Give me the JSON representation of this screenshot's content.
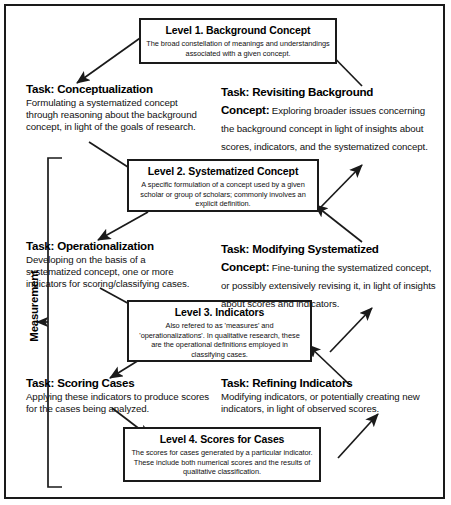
{
  "diagram": {
    "title_hidden": "",
    "colors": {
      "stroke": "#1a1a1a",
      "text": "#000000",
      "background": "#ffffff"
    },
    "bracket_label": "Measurement",
    "levels": [
      {
        "id": "level-1",
        "title": "Level 1. Background Concept",
        "body": "The broad constellation of meanings and understandings associated with a given concept."
      },
      {
        "id": "level-2",
        "title": "Level 2. Systematized Concept",
        "body": "A specific formulation of a concept used by a given scholar or group of scholars; commonly involves an explicit definition."
      },
      {
        "id": "level-3",
        "title": "Level 3. Indicators",
        "body": "Also refered to as 'measures' and 'operationalizations'. In qualitative research, these are the operational definitions employed in classifying cases."
      },
      {
        "id": "level-4",
        "title": "Level 4. Scores for Cases",
        "body": "The scores for cases generated by a particular indicator. These include both numerical scores and the results of qualitative classification."
      }
    ],
    "tasks_left": [
      {
        "id": "task-conceptualization",
        "head": "Task: Conceptualization",
        "body": "Formulating a systematized concept through reasoning about the background concept, in light of the goals of research."
      },
      {
        "id": "task-operationalization",
        "head": "Task: Operationalization",
        "body": "Developing on the basis of a systematized concept, one or more indicators for scoring/classifying cases."
      },
      {
        "id": "task-scoring-cases",
        "head": "Task: Scoring Cases",
        "body": "Applying these indicators to produce scores for the cases being analyzed."
      }
    ],
    "tasks_right": [
      {
        "id": "task-revisiting-background",
        "head": "Task: Revisiting Background",
        "head_cont": "Concept:",
        "body": " Exploring broader issues concerning the background concept in light of insights about scores, indicators, and the systematized concept."
      },
      {
        "id": "task-modifying-systematized",
        "head": "Task: Modifying Systematized",
        "head_cont": "Concept:",
        "body": " Fine-tuning the systematized concept, or possibly extensively revising it, in light of insights about scores and indicators."
      },
      {
        "id": "task-refining-indicators",
        "head": "Task: Refining Indicators",
        "head_cont": "",
        "body": "Modifying indicators, or potentially creating new indicators, in light of observed scores."
      }
    ]
  }
}
